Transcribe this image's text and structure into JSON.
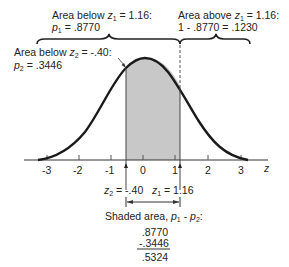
{
  "diagram": {
    "type": "standard-normal-curve",
    "axis": {
      "label": "z",
      "ticks": [
        "-3",
        "-2",
        "-1",
        "0",
        "1",
        "2",
        "3"
      ]
    },
    "top_left_annotation": {
      "line1_prefix": "Area below ",
      "line1_var": "z",
      "line1_sub": "1",
      "line1_suffix": " = 1.16:",
      "line2_var": "p",
      "line2_sub": "1",
      "line2_suffix": " = .8770"
    },
    "top_right_annotation": {
      "line1_prefix": "Area above ",
      "line1_var": "z",
      "line1_sub": "1",
      "line1_suffix": " = 1.16:",
      "line2": "1 - .8770 = .1230"
    },
    "left_annotation": {
      "line1_prefix": "Area below ",
      "line1_var": "z",
      "line1_sub": "2",
      "line1_suffix": " = -.40:",
      "line2_var": "p",
      "line2_sub": "2",
      "line2_suffix": " = .3446"
    },
    "z_markers": {
      "z2_var": "z",
      "z2_sub": "2",
      "z2_value": " = -.40",
      "z1_var": "z",
      "z1_sub": "1",
      "z1_value": " = 1.16"
    },
    "shaded_area": {
      "label_prefix": "Shaded area, ",
      "label_expr_p1": "p",
      "label_sub1": "1",
      "label_minus": " - ",
      "label_expr_p2": "p",
      "label_sub2": "2",
      "label_colon": ":",
      "line1": ".8770",
      "line2": "-.3446",
      "result": ".5324"
    },
    "colors": {
      "curve": "#1a1a1a",
      "shade": "#c8c8c8",
      "axis": "#333333"
    }
  }
}
